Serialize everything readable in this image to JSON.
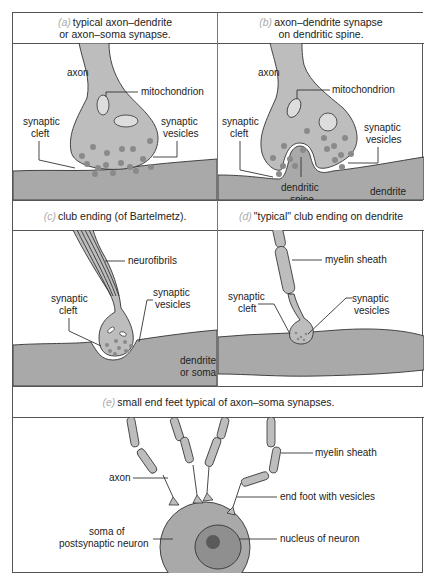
{
  "figure": {
    "colors": {
      "axon_fill": "#bdbdbd",
      "vesicle": "#8a8a8a",
      "tissue": "#a9a9a9",
      "outline": "#333333",
      "tag": "#aaaaaa"
    },
    "panels": [
      {
        "id": "a",
        "tag": "(a)",
        "title_line1": "typical axon–dendrite",
        "title_line2": "or axon–soma synapse.",
        "labels": {
          "axon": "axon",
          "mitochondrion": "mitochondrion",
          "synaptic_cleft_1": "synaptic",
          "synaptic_cleft_2": "cleft",
          "synaptic_vesicles_1": "synaptic",
          "synaptic_vesicles_2": "vesicles"
        }
      },
      {
        "id": "b",
        "tag": "(b)",
        "title_line1": "axon–dendrite synapse",
        "title_line2": "on dendritic spine.",
        "labels": {
          "axon": "axon",
          "mitochondrion": "mitochondrion",
          "synaptic_cleft_1": "synaptic",
          "synaptic_cleft_2": "cleft",
          "synaptic_vesicles_1": "synaptic",
          "synaptic_vesicles_2": "vesicles",
          "dendritic_spine_1": "dendritic",
          "dendritic_spine_2": "spine",
          "dendrite": "dendrite"
        }
      },
      {
        "id": "c",
        "tag": "(c)",
        "title_line1": "club ending (of Bartelmetz).",
        "labels": {
          "neurofibrils": "neurofibrils",
          "synaptic_cleft_1": "synaptic",
          "synaptic_cleft_2": "cleft",
          "synaptic_vesicles_1": "synaptic",
          "synaptic_vesicles_2": "vesicles",
          "dendrite_or_soma_1": "dendrite",
          "dendrite_or_soma_2": "or soma"
        }
      },
      {
        "id": "d",
        "tag": "(d)",
        "title_line1": "\"typical\" club ending on dendrite",
        "labels": {
          "myelin_sheath": "myelin sheath",
          "synaptic_cleft_1": "synaptic",
          "synaptic_cleft_2": "cleft",
          "synaptic_vesicles_1": "synaptic",
          "synaptic_vesicles_2": "vesicles"
        }
      },
      {
        "id": "e",
        "tag": "(e)",
        "title_line1": "small end feet typical of axon–soma synapses.",
        "labels": {
          "axon": "axon",
          "myelin_sheath": "myelin sheath",
          "end_foot": "end foot with vesicles",
          "soma_1": "soma of",
          "soma_2": "postsynaptic neuron",
          "nucleus": "nucleus of neuron"
        }
      }
    ]
  }
}
